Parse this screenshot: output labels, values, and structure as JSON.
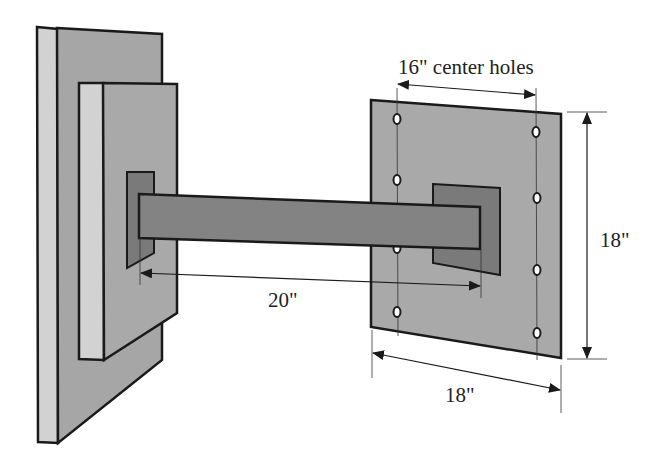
{
  "diagram": {
    "type": "engineering-dimension-drawing",
    "labels": {
      "hole_spacing": "16\" center holes",
      "plate_height": "18\"",
      "plate_width": "18\"",
      "beam_length": "20\""
    },
    "colors": {
      "background": "#ffffff",
      "wall_front": "#a6a6a6",
      "wall_edge": "#d2d2d2",
      "plate_face": "#a9a9a9",
      "mount_block": "#7a7a7a",
      "beam": "#838383",
      "outline": "#1a1a1a"
    },
    "components": [
      {
        "name": "back-wall-plate"
      },
      {
        "name": "front-wall-plate"
      },
      {
        "name": "left-mount-block"
      },
      {
        "name": "horizontal-beam"
      },
      {
        "name": "right-square-plate",
        "bolt_holes": 8
      },
      {
        "name": "right-mount-block"
      }
    ]
  }
}
